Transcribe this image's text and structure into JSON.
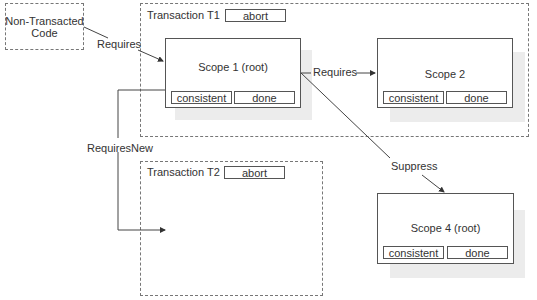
{
  "nodes": {
    "non_transacted": {
      "label": "Non-Transacted\nCode",
      "line1": "Non-Transacted",
      "line2": "Code"
    },
    "transaction_t1": {
      "title": "Transaction T1",
      "abort": "abort"
    },
    "transaction_t2": {
      "title": "Transaction T2",
      "abort": "abort"
    },
    "scope1": {
      "title": "Scope 1 (root)",
      "consistent": "consistent",
      "done": "done"
    },
    "scope2": {
      "title": "Scope 2",
      "consistent": "consistent",
      "done": "done"
    },
    "scope4": {
      "title": "Scope 4 (root)",
      "consistent": "consistent",
      "done": "done"
    }
  },
  "edges": {
    "code_to_scope1": "Requires",
    "scope1_to_scope2": "Requires",
    "scope1_to_t2": "RequiresNew",
    "scope1_to_scope4": "Suppress"
  }
}
